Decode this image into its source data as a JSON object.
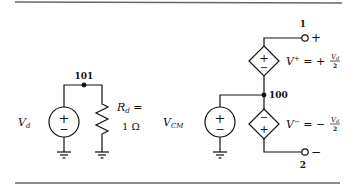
{
  "figure": {
    "rules": {
      "color": "#555555"
    },
    "left_circuit": {
      "source_label": "V",
      "source_label_sub": "d",
      "node_label": "101",
      "resistor_label_main": "R",
      "resistor_label_sub": "d",
      "resistor_label_eq": " =",
      "resistor_value": "1 Ω",
      "source_symbol_plus": "+",
      "source_symbol_minus": "−"
    },
    "right_circuit": {
      "source_label": "V",
      "source_label_sub": "CM",
      "node_label": "100",
      "terminal_1_label": "1",
      "terminal_1_sign": "+",
      "terminal_2_label": "2",
      "terminal_2_sign": "−",
      "upper_dep_source": {
        "lhs": "V",
        "lhs_sup": "+",
        "eq": " = +",
        "frac_num": "V",
        "frac_num_sub": "d",
        "frac_den": "2",
        "top_symbol": "+",
        "bottom_symbol": "−"
      },
      "lower_dep_source": {
        "lhs": "V",
        "lhs_sup": "−",
        "eq": " = −",
        "frac_num": "V",
        "frac_num_sub": "d",
        "frac_den": "2",
        "top_symbol": "−",
        "bottom_symbol": "+"
      },
      "source_symbol_plus": "+",
      "source_symbol_minus": "−"
    }
  }
}
